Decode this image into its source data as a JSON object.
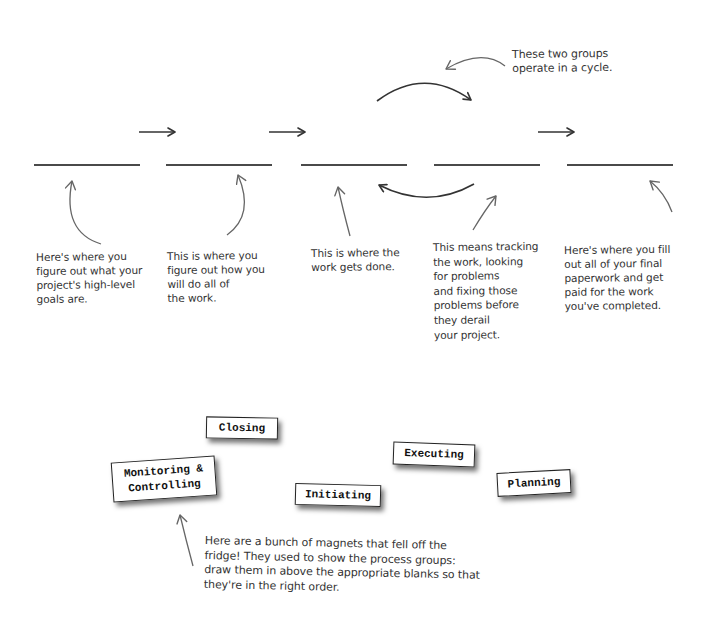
{
  "cycle_note": {
    "text": "These two groups\noperate in a cycle."
  },
  "blanks": [
    {
      "id": 1,
      "value": ""
    },
    {
      "id": 2,
      "value": ""
    },
    {
      "id": 3,
      "value": ""
    },
    {
      "id": 4,
      "value": ""
    },
    {
      "id": 5,
      "value": ""
    }
  ],
  "descriptions": [
    {
      "text": "Here's where you\nfigure out what your\nproject's high-level\ngoals are."
    },
    {
      "text": "This is where you\nfigure out how you\nwill do all of\nthe work."
    },
    {
      "text": "This is where the\nwork gets done."
    },
    {
      "text": "This means tracking\nthe work, looking\nfor problems\nand fixing those\nproblems before\nthey derail\nyour project."
    },
    {
      "text": "Here's where you fill\nout all of your final\npaperwork and get\npaid for the work\nyou've completed."
    }
  ],
  "magnets": [
    {
      "label": "Closing"
    },
    {
      "label": "Monitoring &\nControlling"
    },
    {
      "label": "Executing"
    },
    {
      "label": "Initiating"
    },
    {
      "label": "Planning"
    }
  ],
  "instructions": {
    "text": "Here are a bunch of magnets that fell off the\nfridge! They used to show the process groups:\ndraw them in above the appropriate blanks so that\nthey're in the right order."
  },
  "colors": {
    "ink": "#333333",
    "line": "#4a4a4a",
    "magnet_border": "#222222",
    "background": "#ffffff"
  }
}
